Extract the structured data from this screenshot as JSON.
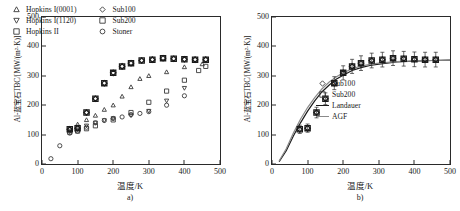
{
  "figure": {
    "y_axis_label": "Al-蓝宝石TBC/[MW/(m²·K)]",
    "x_axis_label": "温度/K",
    "yticks": [
      "0",
      "100",
      "200",
      "300",
      "400",
      "500"
    ],
    "xticks": [
      "0",
      "100",
      "200",
      "300",
      "400",
      "500"
    ],
    "ylim": [
      0,
      500
    ],
    "xlim": [
      0,
      500
    ]
  },
  "panel_a": {
    "caption": "a)",
    "legend": [
      {
        "label": "Hopkins I(0001)",
        "marker": "triangle-up"
      },
      {
        "label": "Sub100",
        "marker": "diamond"
      },
      {
        "label": "Hopkins I(1120)",
        "marker": "triangle-down"
      },
      {
        "label": "Sub200",
        "marker": "square"
      },
      {
        "label": "Hopkins II",
        "marker": "square"
      },
      {
        "label": "Stoner",
        "marker": "circle"
      }
    ]
  },
  "panel_b": {
    "caption": "b)",
    "legend": [
      {
        "label": "Sub100",
        "marker": "diamond"
      },
      {
        "label": "Sub200",
        "marker": "square"
      },
      {
        "label": "Landauer",
        "marker": "line-dark"
      },
      {
        "label": "AGF",
        "marker": "line-gray"
      }
    ]
  },
  "chart_data": [
    {
      "type": "scatter",
      "panel": "a)",
      "title": "",
      "xlabel": "温度/K",
      "ylabel": "Al-蓝宝石TBC/[MW/(m²·K)]",
      "xlim": [
        0,
        500
      ],
      "ylim": [
        0,
        500
      ],
      "grid": false,
      "legend_position": "top-left",
      "series": [
        {
          "name": "Hopkins I(0001)",
          "marker": "triangle-up",
          "x": [
            78,
            100,
            125,
            150,
            175,
            200,
            225,
            250,
            275,
            300,
            350,
            400,
            450
          ],
          "y": [
            120,
            135,
            150,
            165,
            185,
            200,
            230,
            262,
            290,
            300,
            313,
            330,
            340
          ]
        },
        {
          "name": "Hopkins I(1120)",
          "marker": "triangle-down",
          "x": [
            78,
            100,
            125,
            150,
            175,
            200,
            250,
            300,
            350,
            400
          ],
          "y": [
            110,
            120,
            130,
            140,
            148,
            155,
            165,
            180,
            215,
            258
          ]
        },
        {
          "name": "Hopkins II",
          "marker": "square",
          "x": [
            78,
            100,
            125,
            150,
            200,
            250,
            300,
            350,
            400,
            440,
            460
          ],
          "y": [
            108,
            112,
            120,
            130,
            150,
            175,
            210,
            248,
            285,
            318,
            332
          ]
        },
        {
          "name": "Stoner",
          "marker": "circle",
          "x": [
            25,
            50,
            78,
            100,
            125,
            150,
            175,
            200,
            225,
            250,
            275,
            300,
            350,
            400
          ],
          "y": [
            18,
            62,
            105,
            112,
            125,
            140,
            148,
            155,
            160,
            168,
            172,
            178,
            200,
            232
          ]
        },
        {
          "name": "Sub100",
          "marker": "diamond",
          "x": [
            78,
            100,
            125,
            150,
            175,
            200,
            225,
            250,
            280,
            310,
            340,
            370,
            400,
            430,
            460
          ],
          "y": [
            118,
            122,
            175,
            222,
            275,
            310,
            332,
            343,
            352,
            355,
            360,
            358,
            356,
            355,
            355
          ]
        },
        {
          "name": "Sub200",
          "marker": "square",
          "x": [
            78,
            100,
            125,
            150,
            175,
            200,
            225,
            250,
            280,
            310,
            340,
            370,
            400,
            430,
            460
          ],
          "y": [
            118,
            122,
            175,
            222,
            275,
            310,
            332,
            343,
            352,
            355,
            360,
            358,
            356,
            355,
            355
          ]
        }
      ]
    },
    {
      "type": "scatter",
      "panel": "b)",
      "title": "",
      "xlabel": "温度/K",
      "ylabel": "Al-蓝宝石TBC/[MW/(m²·K)]",
      "xlim": [
        0,
        500
      ],
      "ylim": [
        0,
        500
      ],
      "grid": false,
      "legend_position": "bottom-right",
      "series": [
        {
          "name": "Sub100",
          "marker": "diamond",
          "x": [
            78,
            100,
            125,
            150,
            175,
            200,
            225,
            250,
            280,
            310,
            340,
            370,
            400,
            430,
            460
          ],
          "y": [
            118,
            122,
            175,
            222,
            275,
            310,
            332,
            343,
            352,
            355,
            360,
            358,
            356,
            355,
            355
          ],
          "yerr": [
            14,
            14,
            18,
            20,
            22,
            24,
            24,
            25,
            25,
            25,
            25,
            25,
            25,
            25,
            25
          ]
        },
        {
          "name": "Sub200",
          "marker": "square",
          "x": [
            78,
            100,
            125,
            150,
            175,
            200,
            225,
            250,
            280,
            310,
            340,
            370,
            400,
            430,
            460
          ],
          "y": [
            118,
            122,
            175,
            222,
            275,
            310,
            332,
            343,
            352,
            355,
            360,
            358,
            356,
            355,
            355
          ],
          "yerr": [
            14,
            14,
            18,
            20,
            22,
            24,
            24,
            25,
            25,
            25,
            25,
            25,
            25,
            25,
            25
          ]
        },
        {
          "name": "Landauer",
          "type": "line",
          "color": "#1a1a1a",
          "x": [
            20,
            40,
            60,
            80,
            100,
            120,
            140,
            160,
            180,
            200,
            225,
            250,
            275,
            300,
            350,
            400,
            450,
            500
          ],
          "y": [
            8,
            45,
            95,
            140,
            180,
            215,
            245,
            268,
            288,
            302,
            318,
            328,
            335,
            340,
            347,
            350,
            352,
            353
          ]
        },
        {
          "name": "AGF",
          "type": "line",
          "color": "#8a8a8a",
          "x": [
            20,
            40,
            60,
            80,
            100,
            120,
            140,
            160,
            180,
            200,
            225,
            250,
            275,
            300,
            350,
            400,
            450,
            500
          ],
          "y": [
            10,
            52,
            105,
            152,
            192,
            226,
            255,
            278,
            296,
            310,
            324,
            333,
            339,
            343,
            348,
            351,
            352,
            353
          ]
        }
      ]
    }
  ]
}
